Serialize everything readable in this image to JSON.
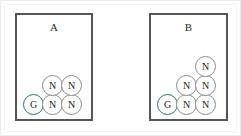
{
  "figure": {
    "background_color": "#ffffff",
    "frame_color": "#eceaea",
    "panels": [
      {
        "id": "panel-a",
        "label": "A",
        "border_color": "#565656",
        "node_count": 5,
        "nodes": [
          {
            "label": "G",
            "type": "goal",
            "row": 0,
            "col": 0,
            "x": 6,
            "y": 79,
            "color": "#2f6f66"
          },
          {
            "label": "N",
            "type": "normal",
            "row": 0,
            "col": 1,
            "x": 25,
            "y": 79,
            "color": "#8b8b8b"
          },
          {
            "label": "N",
            "type": "normal",
            "row": 0,
            "col": 2,
            "x": 44,
            "y": 79,
            "color": "#8b8b8b"
          },
          {
            "label": "N",
            "type": "normal",
            "row": 1,
            "col": 1,
            "x": 25,
            "y": 60,
            "color": "#8b8b8b"
          },
          {
            "label": "N",
            "type": "normal",
            "row": 1,
            "col": 2,
            "x": 44,
            "y": 60,
            "color": "#8b8b8b"
          }
        ]
      },
      {
        "id": "panel-b",
        "label": "B",
        "border_color": "#565656",
        "node_count": 6,
        "nodes": [
          {
            "label": "G",
            "type": "goal",
            "row": 0,
            "col": 0,
            "x": 6,
            "y": 79,
            "color": "#2f6f66"
          },
          {
            "label": "N",
            "type": "normal",
            "row": 0,
            "col": 1,
            "x": 25,
            "y": 79,
            "color": "#8b8b8b"
          },
          {
            "label": "N",
            "type": "normal",
            "row": 0,
            "col": 2,
            "x": 44,
            "y": 79,
            "color": "#8b8b8b"
          },
          {
            "label": "N",
            "type": "normal",
            "row": 1,
            "col": 1,
            "x": 25,
            "y": 60,
            "color": "#8b8b8b"
          },
          {
            "label": "N",
            "type": "normal",
            "row": 1,
            "col": 2,
            "x": 44,
            "y": 60,
            "color": "#8b8b8b"
          },
          {
            "label": "N",
            "type": "normal",
            "row": 2,
            "col": 2,
            "x": 44,
            "y": 41,
            "color": "#8b8b8b"
          }
        ]
      }
    ],
    "legend": {
      "goal_symbol": "G",
      "normal_symbol": "N"
    }
  }
}
